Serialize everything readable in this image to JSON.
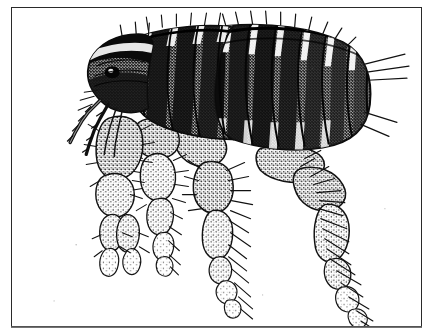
{
  "plate": {
    "title": "Flea",
    "subject": "flea (Siphonaptera), lateral view",
    "illustration_style": "stipple-and-line engraving, black ink on white",
    "orientation": "head at left, abdomen at right, legs below",
    "background_color": "#ffffff",
    "ink_color": "#111111",
    "frame_color": "#2a2a2a",
    "midtone_color": "#6f6f6f",
    "caption": ""
  },
  "figure": {
    "name": "flea-lateral-illustration",
    "parts": [
      {
        "id": "head",
        "label": "Head"
      },
      {
        "id": "eye",
        "label": "Eye"
      },
      {
        "id": "antenna",
        "label": "Antenna"
      },
      {
        "id": "maxillary-palp",
        "label": "Maxillary palp"
      },
      {
        "id": "mouthparts",
        "label": "Mouthparts / stylets"
      },
      {
        "id": "pronotum",
        "label": "Pronotum"
      },
      {
        "id": "thorax",
        "label": "Thorax"
      },
      {
        "id": "abdomen",
        "label": "Abdomen"
      },
      {
        "id": "abdominal-segments",
        "label": "Abdominal terga"
      },
      {
        "id": "bristles",
        "label": "Bristles / setae"
      },
      {
        "id": "foreleg",
        "label": "Foreleg"
      },
      {
        "id": "midleg",
        "label": "Midleg"
      },
      {
        "id": "hindleg",
        "label": "Hind leg"
      },
      {
        "id": "coxa",
        "label": "Coxa"
      },
      {
        "id": "femur",
        "label": "Femur"
      },
      {
        "id": "tibia",
        "label": "Tibia"
      },
      {
        "id": "tarsus",
        "label": "Tarsus"
      },
      {
        "id": "claw",
        "label": "Tarsal claw"
      }
    ]
  }
}
